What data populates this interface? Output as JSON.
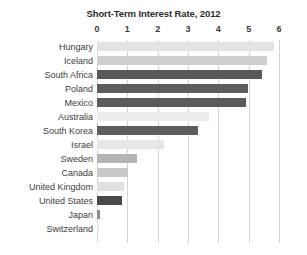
{
  "chart_data": {
    "type": "bar",
    "orientation": "horizontal",
    "title": "Short-Term Interest Rate, 2012",
    "xlabel": "",
    "ylabel": "",
    "xlim": [
      0,
      6
    ],
    "xticks": [
      "0",
      "1",
      "2",
      "3",
      "4",
      "5",
      "6"
    ],
    "grid": true,
    "legend": "none",
    "categories": [
      "Hungary",
      "Iceland",
      "South Africa",
      "Poland",
      "Mexico",
      "Australia",
      "South Korea",
      "Israel",
      "Sweden",
      "Canada",
      "United Kingdom",
      "United States",
      "Japan",
      "Switzerland"
    ],
    "values": [
      5.85,
      5.6,
      5.45,
      4.98,
      4.92,
      3.7,
      3.33,
      2.2,
      1.32,
      1.02,
      0.9,
      0.83,
      0.1,
      0.05
    ],
    "bar_colors": [
      "#e3e3e3",
      "#cfcfcf",
      "#595959",
      "#5d5d5d",
      "#5a5a5a",
      "#ececec",
      "#5e5e5e",
      "#e6e6e6",
      "#b4b4b4",
      "#c9c9c9",
      "#e0e0e0",
      "#4a4a4a",
      "#8e8e8e",
      "#e8e8e8"
    ]
  },
  "style": {
    "grid_color": "#d4d4d4",
    "title_color": "#2b2b2b",
    "label_color": "#3d3d3d",
    "background": "#ffffff"
  }
}
